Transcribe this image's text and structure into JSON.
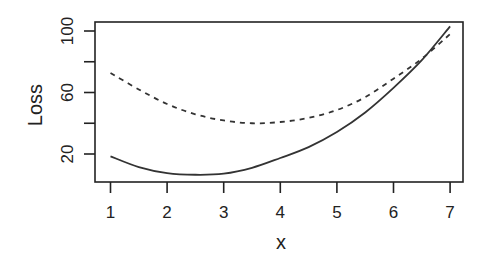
{
  "chart_data": {
    "type": "line",
    "title": "",
    "xlabel": "x",
    "ylabel": "Loss",
    "xlim": [
      0.82,
      7.23
    ],
    "ylim": [
      1.8,
      106.5
    ],
    "xticks": [
      1,
      2,
      3,
      4,
      5,
      6,
      7
    ],
    "xtick_labels": [
      "1",
      "2",
      "3",
      "4",
      "5",
      "6",
      "7"
    ],
    "yticks": [
      20,
      40,
      60,
      80,
      100
    ],
    "ytick_labels": [
      "20",
      "",
      "60",
      "",
      "100"
    ],
    "grid": false,
    "legend": null,
    "x": [
      1,
      1.5,
      2,
      2.5,
      3,
      3.5,
      4,
      4.5,
      5,
      5.5,
      6,
      6.5,
      7
    ],
    "series": [
      {
        "name": "solid",
        "style": "solid",
        "color": "#333333",
        "values": [
          18.5,
          11.5,
          7.6,
          6.5,
          7.2,
          11,
          17.4,
          24.5,
          34.3,
          47,
          63,
          81,
          103
        ]
      },
      {
        "name": "dashed",
        "style": "dashed",
        "color": "#333333",
        "values": [
          72.7,
          62,
          52.5,
          45.8,
          41.8,
          40,
          40.8,
          43.5,
          48.6,
          57,
          69,
          82,
          98
        ]
      }
    ]
  }
}
